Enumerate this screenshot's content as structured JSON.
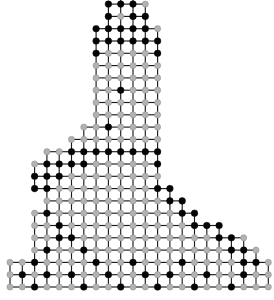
{
  "figure": {
    "title": "",
    "kind": "finite-element-mesh",
    "background_color": "#ffffff",
    "line_color": "#1a1a1a",
    "node_open_color": "#b2b2b2",
    "node_filled_color": "#050505"
  },
  "grid": {
    "cell_width": 12.3,
    "cell_height": 12.3,
    "origin_x": 10.0,
    "origin_y": 287.0,
    "columns": 21,
    "rows": 24,
    "note": "origin is bottom-left of the mesh; rows counted upward"
  },
  "legend": {
    "open_node_label": "mesh node",
    "filled_node_label": "marked node"
  },
  "mesh_data": {
    "type": "grid-occupancy",
    "description": "Per-row spans of occupied grid cells, row 0 = bottom. Each span is [col_start, col_end_exclusive].",
    "rows": [
      {
        "row": 0,
        "spans": [
          [
            0,
            21
          ]
        ]
      },
      {
        "row": 1,
        "spans": [
          [
            0,
            21
          ]
        ]
      },
      {
        "row": 2,
        "spans": [
          [
            2,
            20
          ]
        ]
      },
      {
        "row": 3,
        "spans": [
          [
            2,
            19
          ]
        ]
      },
      {
        "row": 4,
        "spans": [
          [
            2,
            17
          ]
        ]
      },
      {
        "row": 5,
        "spans": [
          [
            2,
            15
          ]
        ]
      },
      {
        "row": 6,
        "spans": [
          [
            3,
            14
          ]
        ]
      },
      {
        "row": 7,
        "spans": [
          [
            3,
            13
          ]
        ]
      },
      {
        "row": 8,
        "spans": [
          [
            2,
            12
          ]
        ]
      },
      {
        "row": 9,
        "spans": [
          [
            2,
            12
          ]
        ]
      },
      {
        "row": 10,
        "spans": [
          [
            3,
            12
          ]
        ]
      },
      {
        "row": 11,
        "spans": [
          [
            5,
            12
          ]
        ]
      },
      {
        "row": 12,
        "spans": [
          [
            6,
            12
          ]
        ]
      },
      {
        "row": 13,
        "spans": [
          [
            7,
            12
          ]
        ]
      },
      {
        "row": 14,
        "spans": [
          [
            7,
            12
          ]
        ]
      },
      {
        "row": 15,
        "spans": [
          [
            7,
            12
          ]
        ]
      },
      {
        "row": 16,
        "spans": [
          [
            7,
            12
          ]
        ]
      },
      {
        "row": 17,
        "spans": [
          [
            7,
            12
          ]
        ]
      },
      {
        "row": 18,
        "spans": [
          [
            7,
            12
          ]
        ]
      },
      {
        "row": 19,
        "spans": [
          [
            7,
            12
          ]
        ]
      },
      {
        "row": 20,
        "spans": [
          [
            7,
            12
          ]
        ]
      },
      {
        "row": 21,
        "spans": [
          [
            8,
            11
          ]
        ]
      },
      {
        "row": 22,
        "spans": [
          [
            8,
            11
          ]
        ]
      },
      {
        "row": 23,
        "spans": [
          [
            9,
            10
          ]
        ]
      }
    ],
    "filled_nodes": [
      [
        9,
        24
      ],
      [
        8,
        23
      ],
      [
        9,
        23
      ],
      [
        10,
        23
      ],
      [
        8,
        22
      ],
      [
        11,
        22
      ],
      [
        7,
        22
      ],
      [
        10,
        22
      ],
      [
        8,
        21
      ],
      [
        9,
        21
      ],
      [
        10,
        21
      ],
      [
        11,
        21
      ],
      [
        7,
        21
      ],
      [
        7,
        20
      ],
      [
        8,
        20
      ],
      [
        9,
        20
      ],
      [
        10,
        20
      ],
      [
        11,
        20
      ],
      [
        12,
        20
      ],
      [
        7,
        19
      ],
      [
        12,
        19
      ],
      [
        9,
        16
      ],
      [
        8,
        13
      ],
      [
        7,
        11
      ],
      [
        8,
        11
      ],
      [
        9,
        11
      ],
      [
        10,
        11
      ],
      [
        11,
        11
      ],
      [
        12,
        11
      ],
      [
        6,
        11
      ],
      [
        5,
        11
      ],
      [
        5,
        10
      ],
      [
        6,
        10
      ],
      [
        12,
        10
      ],
      [
        4,
        10
      ],
      [
        3,
        10
      ],
      [
        3,
        9
      ],
      [
        4,
        9
      ],
      [
        2,
        9
      ],
      [
        2,
        8
      ],
      [
        3,
        8
      ],
      [
        12,
        8
      ],
      [
        13,
        8
      ],
      [
        2,
        7
      ],
      [
        13,
        7
      ],
      [
        14,
        7
      ],
      [
        3,
        6
      ],
      [
        14,
        6
      ],
      [
        15,
        6
      ],
      [
        4,
        5
      ],
      [
        15,
        5
      ],
      [
        16,
        5
      ],
      [
        17,
        5
      ],
      [
        4,
        4
      ],
      [
        5,
        4
      ],
      [
        17,
        4
      ],
      [
        18,
        4
      ],
      [
        3,
        3
      ],
      [
        6,
        3
      ],
      [
        18,
        3
      ],
      [
        19,
        3
      ],
      [
        2,
        2
      ],
      [
        7,
        2
      ],
      [
        10,
        2
      ],
      [
        14,
        2
      ],
      [
        19,
        2
      ],
      [
        20,
        2
      ],
      [
        1,
        1
      ],
      [
        3,
        1
      ],
      [
        5,
        1
      ],
      [
        8,
        1
      ],
      [
        11,
        1
      ],
      [
        13,
        1
      ],
      [
        16,
        1
      ],
      [
        19,
        1
      ],
      [
        2,
        0
      ],
      [
        6,
        0
      ],
      [
        9,
        0
      ],
      [
        12,
        0
      ],
      [
        15,
        0
      ],
      [
        18,
        0
      ]
    ]
  }
}
